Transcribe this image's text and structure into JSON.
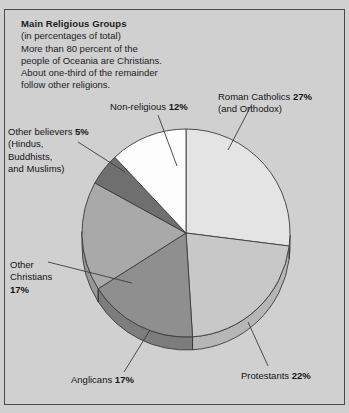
{
  "caption": {
    "title": "Main Religious Groups",
    "lines": [
      "(in percentages of total)",
      "More than 80 percent of the",
      "people of Oceania are Christians.",
      "About one-third of the remainder",
      "follow other religions."
    ]
  },
  "labels": {
    "catholic": {
      "line1": "Roman Catholics ",
      "value": "27%",
      "line2": "(and Orthodox)"
    },
    "nonreligious": {
      "line1": "Non-religious ",
      "value": "12%"
    },
    "other_believers": {
      "line1": "Other believers ",
      "value": "5%",
      "line2": "(Hindus,",
      "line3": "Buddhists,",
      "line4": "and Muslims)"
    },
    "other_christians": {
      "line1": "Other",
      "line2": "Christians",
      "value": "17%"
    },
    "anglicans": {
      "line1": "Anglicans ",
      "value": "17%"
    },
    "protestants": {
      "line1": "Protestants ",
      "value": "22%"
    }
  },
  "chart_data": {
    "type": "pie",
    "title": "Main Religious Groups",
    "subtitle": "(in percentages of total)",
    "unit": "percent",
    "total": 100,
    "start_angle_deg": 0,
    "direction": "clockwise",
    "legend": "none (direct labels with leader lines)",
    "categories": [
      "Roman Catholics (and Orthodox)",
      "Protestants",
      "Anglicans",
      "Other Christians",
      "Other believers (Hindus, Buddhists, and Muslims)",
      "Non-religious"
    ],
    "values": [
      27,
      22,
      17,
      17,
      5,
      12
    ],
    "labels": [
      "27%",
      "22%",
      "17%",
      "17%",
      "5%",
      "12%"
    ],
    "colors": [
      "#e4e4e4",
      "#c8c8c8",
      "#8f8f8f",
      "#a9a9a9",
      "#6f6f6f",
      "#fdfdfd"
    ],
    "annotations": [
      "More than 80 percent of the people of Oceania are Christians.",
      "About one-third of the remainder follow other religions."
    ]
  },
  "style": {
    "background": "#d0d0d1",
    "border": "#4a4a4a",
    "stroke": "#3c3c3c",
    "text": "#141414"
  }
}
